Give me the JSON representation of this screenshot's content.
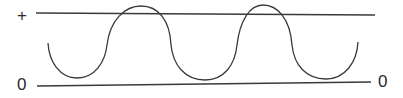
{
  "diagram": {
    "type": "waveform",
    "labels": {
      "top_left": "+",
      "bottom_left": "0",
      "bottom_right": "0"
    },
    "reference_lines": [
      {
        "name": "positive-level-line"
      },
      {
        "name": "zero-level-line"
      }
    ],
    "wave": {
      "cycles": 2,
      "description": "Sinusoidal wave oscillating between the zero line and above the positive line"
    },
    "colors": {
      "stroke": "#3a3a3a",
      "background": "#ffffff"
    }
  }
}
